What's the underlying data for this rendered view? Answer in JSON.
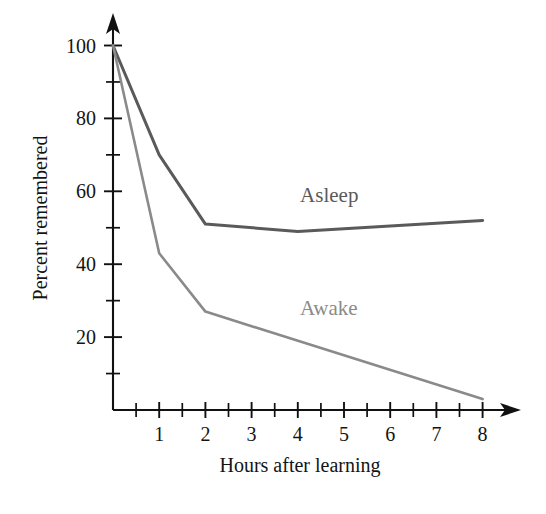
{
  "chart_data": {
    "type": "line",
    "title": "",
    "xlabel": "Hours after learning",
    "ylabel": "Percent remembered",
    "xlim": [
      0,
      8.7
    ],
    "ylim": [
      0,
      106
    ],
    "grid": false,
    "legend": "inline-labels",
    "x_ticks_major": [
      1,
      2,
      3,
      4,
      5,
      6,
      7,
      8
    ],
    "x_tick_labels": [
      "1",
      "2",
      "3",
      "4",
      "5",
      "6",
      "7",
      "8"
    ],
    "x_ticks_minor": [
      0.5,
      1.5,
      2.5,
      3.5,
      4.5,
      5.5,
      6.5,
      7.5
    ],
    "y_ticks_major": [
      20,
      40,
      60,
      80,
      100
    ],
    "y_tick_labels": [
      "20",
      "40",
      "60",
      "80",
      "100"
    ],
    "y_ticks_minor": [
      10,
      30,
      50,
      70,
      90
    ],
    "series": [
      {
        "name": "Asleep",
        "color": "#5a5a5a",
        "stroke_width": 3.0,
        "x": [
          0,
          1,
          2,
          4,
          8
        ],
        "values": [
          100,
          70,
          51,
          49,
          52
        ],
        "label_x": 4.05,
        "label_y": 57
      },
      {
        "name": "Awake",
        "color": "#8a8a8a",
        "stroke_width": 2.6,
        "x": [
          0,
          1,
          2,
          8
        ],
        "values": [
          100,
          43,
          27,
          3
        ],
        "label_x": 4.05,
        "label_y": 26
      }
    ]
  },
  "axes": {
    "y_axis_title": "Percent remembered",
    "x_axis_title": "Hours after learning",
    "axis_color": "#111111"
  }
}
